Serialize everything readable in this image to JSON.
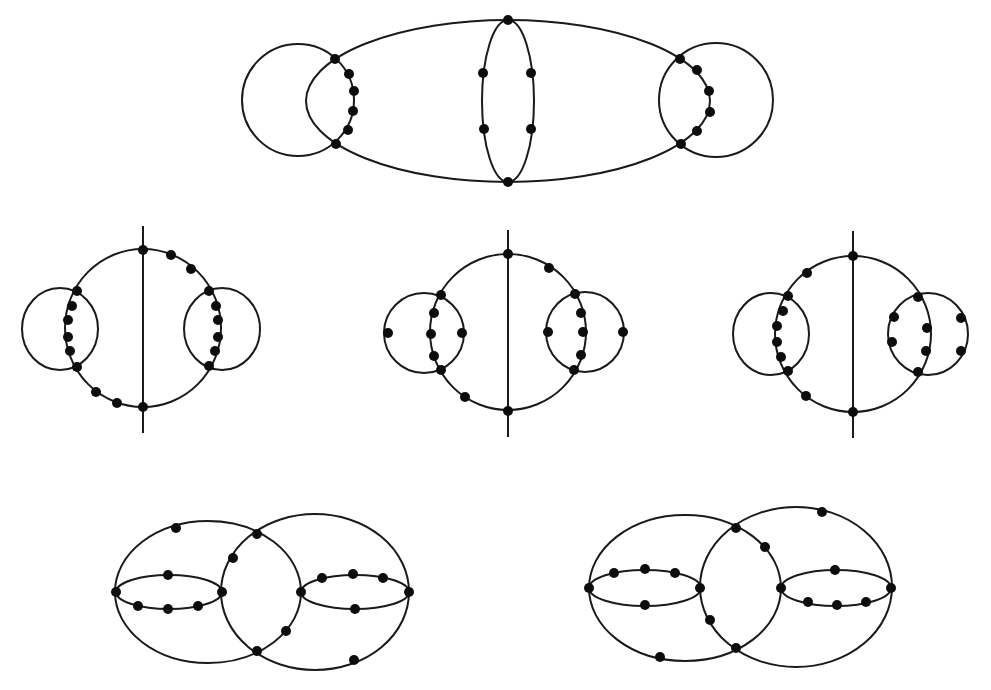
{
  "figure": {
    "width": 991,
    "height": 690,
    "background": "#ffffff",
    "stroke_color": "#1a1a1a",
    "vertex_color": "#0d0d0d",
    "vertex_radius": 5
  },
  "diagrams": [
    {
      "id": "top-diagram",
      "ellipses": [
        {
          "cx": 508,
          "cy": 101,
          "rx": 202,
          "ry": 81
        },
        {
          "cx": 508,
          "cy": 101,
          "rx": 26,
          "ry": 81
        },
        {
          "cx": 298,
          "cy": 100,
          "rx": 56,
          "ry": 56
        },
        {
          "cx": 716,
          "cy": 100,
          "rx": 57,
          "ry": 57
        }
      ],
      "lines": [],
      "vertices": [
        [
          508,
          20
        ],
        [
          508,
          182
        ],
        [
          483,
          73
        ],
        [
          531,
          73
        ],
        [
          484,
          129
        ],
        [
          531,
          129
        ],
        [
          335,
          59
        ],
        [
          336,
          144
        ],
        [
          349,
          74
        ],
        [
          354,
          91
        ],
        [
          353,
          111
        ],
        [
          348,
          130
        ],
        [
          680,
          59
        ],
        [
          681,
          144
        ],
        [
          697,
          70
        ],
        [
          709,
          91
        ],
        [
          710,
          112
        ],
        [
          697,
          131
        ]
      ]
    },
    {
      "id": "middle-left-diagram",
      "ellipses": [
        {
          "cx": 143,
          "cy": 328,
          "rx": 78,
          "ry": 79
        },
        {
          "cx": 60,
          "cy": 329,
          "rx": 38,
          "ry": 41
        },
        {
          "cx": 222,
          "cy": 329,
          "rx": 38,
          "ry": 41
        }
      ],
      "lines": [
        {
          "x1": 143,
          "y1": 226,
          "x2": 143,
          "y2": 433
        }
      ],
      "vertices": [
        [
          143,
          250
        ],
        [
          143,
          407
        ],
        [
          171,
          255
        ],
        [
          191,
          269
        ],
        [
          209,
          291
        ],
        [
          216,
          306
        ],
        [
          218,
          320
        ],
        [
          218,
          337
        ],
        [
          215,
          351
        ],
        [
          209,
          366
        ],
        [
          77,
          291
        ],
        [
          72,
          306
        ],
        [
          68,
          320
        ],
        [
          68,
          337
        ],
        [
          70,
          351
        ],
        [
          77,
          367
        ],
        [
          96,
          392
        ],
        [
          117,
          403
        ]
      ]
    },
    {
      "id": "middle-center-diagram",
      "ellipses": [
        {
          "cx": 508,
          "cy": 332,
          "rx": 78,
          "ry": 78
        },
        {
          "cx": 424,
          "cy": 333,
          "rx": 40,
          "ry": 40
        },
        {
          "cx": 585,
          "cy": 332,
          "rx": 39,
          "ry": 40
        }
      ],
      "lines": [
        {
          "x1": 508,
          "y1": 230,
          "x2": 508,
          "y2": 437
        }
      ],
      "vertices": [
        [
          508,
          254
        ],
        [
          508,
          411
        ],
        [
          549,
          268
        ],
        [
          465,
          397
        ],
        [
          441,
          295
        ],
        [
          441,
          370
        ],
        [
          388,
          333
        ],
        [
          462,
          333
        ],
        [
          434,
          313
        ],
        [
          431,
          334
        ],
        [
          434,
          356
        ],
        [
          575,
          294
        ],
        [
          574,
          370
        ],
        [
          548,
          332
        ],
        [
          623,
          332
        ],
        [
          581,
          313
        ],
        [
          583,
          332
        ],
        [
          581,
          355
        ]
      ]
    },
    {
      "id": "middle-right-diagram",
      "ellipses": [
        {
          "cx": 853,
          "cy": 334,
          "rx": 78,
          "ry": 78
        },
        {
          "cx": 771,
          "cy": 334,
          "rx": 38,
          "ry": 41
        },
        {
          "cx": 928,
          "cy": 334,
          "rx": 40,
          "ry": 41
        }
      ],
      "lines": [
        {
          "x1": 853,
          "y1": 231,
          "x2": 853,
          "y2": 438
        }
      ],
      "vertices": [
        [
          853,
          256
        ],
        [
          853,
          412
        ],
        [
          807,
          273
        ],
        [
          806,
          396
        ],
        [
          788,
          296
        ],
        [
          788,
          371
        ],
        [
          783,
          311
        ],
        [
          777,
          326
        ],
        [
          777,
          342
        ],
        [
          781,
          357
        ],
        [
          918,
          297
        ],
        [
          918,
          372
        ],
        [
          894,
          317
        ],
        [
          892,
          342
        ],
        [
          927,
          328
        ],
        [
          926,
          351
        ],
        [
          961,
          318
        ],
        [
          961,
          351
        ]
      ]
    },
    {
      "id": "bottom-left-diagram",
      "ellipses": [
        {
          "cx": 208,
          "cy": 592,
          "rx": 93,
          "ry": 71
        },
        {
          "cx": 315,
          "cy": 592,
          "rx": 94,
          "ry": 78
        },
        {
          "cx": 169,
          "cy": 592,
          "rx": 53,
          "ry": 17
        },
        {
          "cx": 355,
          "cy": 592,
          "rx": 54,
          "ry": 17
        }
      ],
      "lines": [],
      "vertices": [
        [
          116,
          592
        ],
        [
          222,
          592
        ],
        [
          301,
          592
        ],
        [
          409,
          592
        ],
        [
          257,
          534
        ],
        [
          257,
          651
        ],
        [
          176,
          528
        ],
        [
          168,
          575
        ],
        [
          138,
          606
        ],
        [
          168,
          609
        ],
        [
          198,
          606
        ],
        [
          233,
          558
        ],
        [
          286,
          631
        ],
        [
          322,
          578
        ],
        [
          353,
          574
        ],
        [
          383,
          578
        ],
        [
          355,
          609
        ],
        [
          354,
          660
        ]
      ]
    },
    {
      "id": "bottom-right-diagram",
      "ellipses": [
        {
          "cx": 685,
          "cy": 588,
          "rx": 96,
          "ry": 73
        },
        {
          "cx": 796,
          "cy": 587,
          "rx": 96,
          "ry": 80
        },
        {
          "cx": 645,
          "cy": 588,
          "rx": 56,
          "ry": 18
        },
        {
          "cx": 836,
          "cy": 588,
          "rx": 55,
          "ry": 18
        }
      ],
      "lines": [],
      "vertices": [
        [
          589,
          588
        ],
        [
          700,
          588
        ],
        [
          781,
          588
        ],
        [
          891,
          588
        ],
        [
          736,
          528
        ],
        [
          736,
          648
        ],
        [
          822,
          512
        ],
        [
          765,
          547
        ],
        [
          710,
          620
        ],
        [
          660,
          657
        ],
        [
          614,
          573
        ],
        [
          645,
          569
        ],
        [
          675,
          573
        ],
        [
          645,
          605
        ],
        [
          835,
          570
        ],
        [
          808,
          602
        ],
        [
          837,
          605
        ],
        [
          866,
          602
        ]
      ]
    }
  ]
}
